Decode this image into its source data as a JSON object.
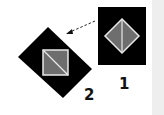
{
  "diagram": {
    "figures": [
      {
        "id": "1",
        "label": "1",
        "shape": "upright black rectangle with gray diamond and vertical white diagonal"
      },
      {
        "id": "2",
        "label": "2",
        "shape": "rotated black rectangle with gray square and white diagonal"
      }
    ],
    "arrow": {
      "from": "1",
      "to": "2",
      "style": "dashed"
    },
    "colors": {
      "outer": "#000000",
      "inner": "#6e6e6e",
      "stroke": "#e8e8e8",
      "edge": "#eeeeee"
    }
  }
}
